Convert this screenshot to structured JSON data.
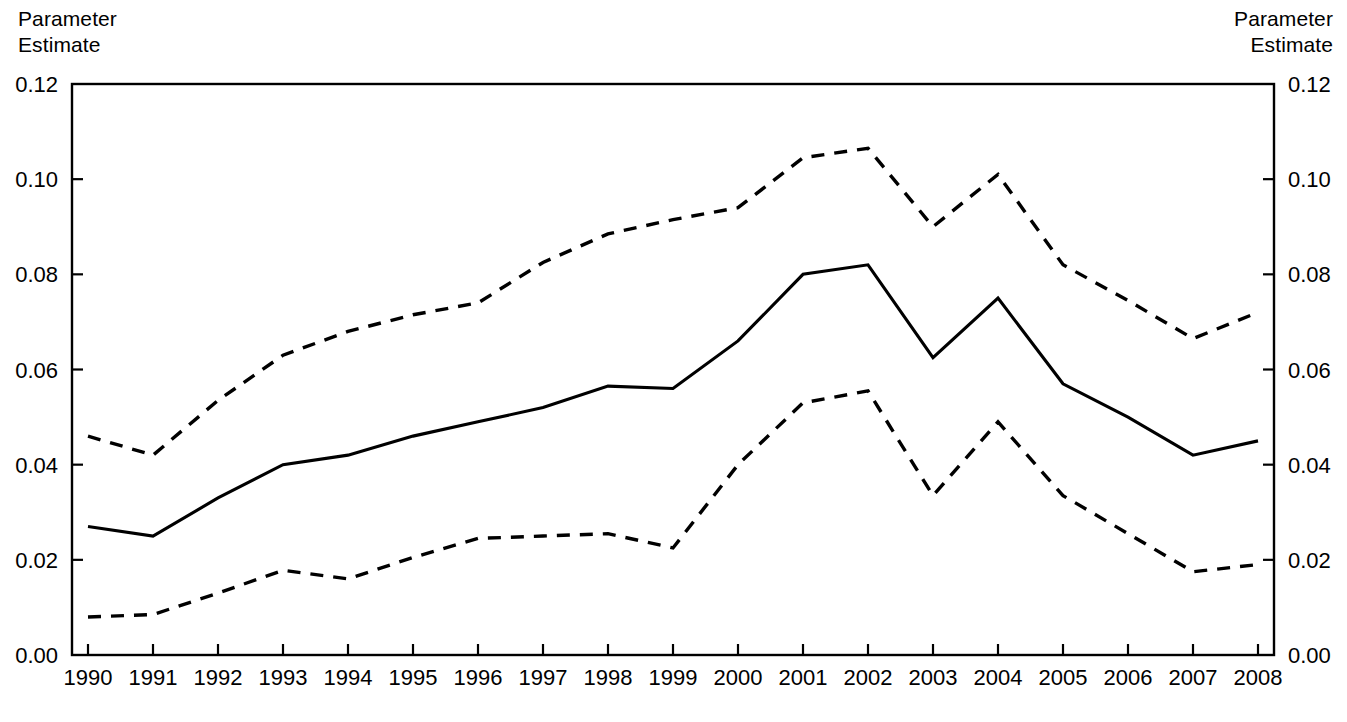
{
  "figure": {
    "left_axis_title": "Parameter\nEstimate",
    "right_axis_title": "Parameter\nEstimate",
    "background_color": "#ffffff",
    "line_color": "#000000"
  },
  "chart_data": {
    "type": "line",
    "title": "",
    "subtitle": "",
    "xlabel": "",
    "ylabel": "Parameter Estimate",
    "y2label": "Parameter Estimate",
    "grid": false,
    "legend_position": "none",
    "xlim": [
      1990,
      2008
    ],
    "ylim": [
      0.0,
      0.12
    ],
    "ytick_labels": [
      "0.00",
      "0.02",
      "0.04",
      "0.06",
      "0.08",
      "0.10",
      "0.12"
    ],
    "ytick_values": [
      0.0,
      0.02,
      0.04,
      0.06,
      0.08,
      0.1,
      0.12
    ],
    "y2tick_labels": [
      "0.00",
      "0.02",
      "0.04",
      "0.06",
      "0.08",
      "0.10",
      "0.12"
    ],
    "categories": [
      1990,
      1991,
      1992,
      1993,
      1994,
      1995,
      1996,
      1997,
      1998,
      1999,
      2000,
      2001,
      2002,
      2003,
      2004,
      2005,
      2006,
      2007,
      2008
    ],
    "xtick_labels": [
      "1990",
      "1991",
      "1992",
      "1993",
      "1994",
      "1995",
      "1996",
      "1997",
      "1998",
      "1999",
      "2000",
      "2001",
      "2002",
      "2003",
      "2004",
      "2005",
      "2006",
      "2007",
      "2008"
    ],
    "series": [
      {
        "name": "Parameter estimate",
        "style": "solid",
        "values": [
          0.027,
          0.025,
          0.033,
          0.04,
          0.042,
          0.046,
          0.049,
          0.052,
          0.0565,
          0.056,
          0.066,
          0.08,
          0.082,
          0.0625,
          0.075,
          0.057,
          0.05,
          0.042,
          0.045
        ]
      },
      {
        "name": "Upper confidence bound",
        "style": "dashed",
        "values": [
          0.046,
          0.042,
          0.0535,
          0.063,
          0.068,
          0.0715,
          0.074,
          0.0825,
          0.0885,
          0.0915,
          0.094,
          0.1045,
          0.1065,
          0.09,
          0.101,
          0.082,
          0.0745,
          0.0665,
          0.072
        ]
      },
      {
        "name": "Lower confidence bound",
        "style": "dashed",
        "values": [
          0.008,
          0.0085,
          0.013,
          0.0178,
          0.016,
          0.0205,
          0.0245,
          0.025,
          0.0255,
          0.0225,
          0.04,
          0.053,
          0.0555,
          0.0335,
          0.049,
          0.0335,
          0.0255,
          0.0175,
          0.019
        ]
      }
    ]
  }
}
